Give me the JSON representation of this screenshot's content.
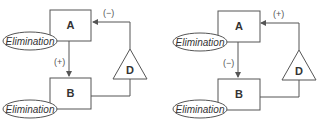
{
  "diagrams": [
    {
      "node_a": "A",
      "node_b": "B",
      "node_d": "D",
      "elimination_a": "Elimination",
      "elimination_b": "Elimination",
      "a_to_b_sign": "(+)",
      "d_to_a_sign": "(−)"
    },
    {
      "node_a": "A",
      "node_b": "B",
      "node_d": "D",
      "elimination_a": "Elimination",
      "elimination_b": "Elimination",
      "a_to_b_sign": "(−)",
      "d_to_a_sign": "(+)"
    }
  ],
  "colors": {
    "stroke": "#555555",
    "text": "#333333"
  }
}
